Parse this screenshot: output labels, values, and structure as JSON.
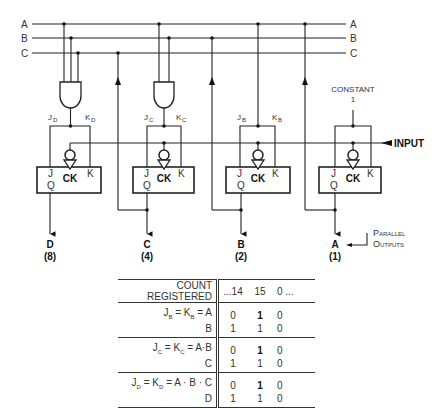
{
  "bus_lines": [
    {
      "label": "A",
      "label_right": "A"
    },
    {
      "label": "B",
      "label_right": "B"
    },
    {
      "label": "C",
      "label_right": "C"
    }
  ],
  "flip_flops": [
    {
      "output": "D",
      "weight": "(8)",
      "j": "J",
      "k": "K",
      "q": "Q",
      "ck": "CK",
      "j_label": "J",
      "j_sub": "D",
      "k_label": "K",
      "k_sub": "D"
    },
    {
      "output": "C",
      "weight": "(4)",
      "j": "J",
      "k": "K",
      "q": "Q",
      "ck": "CK",
      "j_label": "J",
      "j_sub": "C",
      "k_label": "K",
      "k_sub": "C"
    },
    {
      "output": "B",
      "weight": "(2)",
      "j": "J",
      "k": "K",
      "q": "Q",
      "ck": "CK",
      "j_label": "J",
      "j_sub": "B",
      "k_label": "K",
      "k_sub": "B"
    },
    {
      "output": "A",
      "weight": "(1)",
      "j": "J",
      "k": "K",
      "q": "Q",
      "ck": "CK"
    }
  ],
  "constant": {
    "label": "CONSTANT",
    "value": "1"
  },
  "input_label": "INPUT",
  "parallel_outputs": {
    "line1": "Parallel",
    "line2": "Outputs"
  },
  "table": {
    "header": {
      "label": "COUNT REGISTERED",
      "cols": [
        "...14",
        "15",
        "0 ..."
      ]
    },
    "groups": [
      {
        "rows": [
          {
            "label": "J_B = K_B = A",
            "values": [
              "0",
              "1",
              "0"
            ],
            "bold_col": 1
          },
          {
            "label": "B",
            "values": [
              "1",
              "1",
              "0"
            ]
          }
        ]
      },
      {
        "rows": [
          {
            "label": "J_C = K_C = A·B",
            "values": [
              "0",
              "1",
              "0"
            ],
            "bold_col": 1
          },
          {
            "label": "C",
            "values": [
              "1",
              "1",
              "0"
            ]
          }
        ]
      },
      {
        "rows": [
          {
            "label": "J_D = K_D = A · B · C",
            "values": [
              "0",
              "1",
              "0"
            ],
            "bold_col": 1
          },
          {
            "label": "D",
            "values": [
              "1",
              "1",
              "0"
            ]
          }
        ]
      }
    ]
  },
  "text": {
    "hdr_label": "COUNT REGISTERED",
    "hdr_c1": "...14",
    "hdr_c2": "15",
    "hdr_c3": "0 ...",
    "g1r1_a": "J",
    "g1r1_as": "B",
    "g1r1_b": " = K",
    "g1r1_bs": "B",
    "g1r1_c": " = A",
    "g1r2": "B",
    "g2r1_a": "J",
    "g2r1_as": "C",
    "g2r1_b": " = K",
    "g2r1_bs": "C",
    "g2r1_c": " = A·B",
    "g2r2": "C",
    "g3r1_a": "J",
    "g3r1_as": "D",
    "g3r1_b": " = K",
    "g3r1_bs": "D",
    "g3r1_c": " = A · B · C",
    "g3r2": "D"
  }
}
